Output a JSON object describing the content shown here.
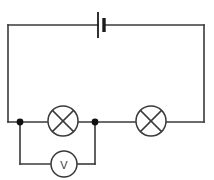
{
  "diagram": {
    "background_color": "#ffffff",
    "line_color": "#3a3a3a",
    "junction_color": "#111111",
    "width": 214,
    "height": 180
  },
  "components": {
    "battery": {
      "name": "battery",
      "symbol": "battery-cell",
      "label": "",
      "position": {
        "x": 101,
        "y": 25
      },
      "long_plate_height": 26,
      "short_plate_height": 14,
      "plate_gap": 5
    },
    "lamp_left": {
      "name": "lamp",
      "symbol": "lamp-crossed-circle",
      "label": "",
      "center": {
        "x": 63,
        "y": 121
      },
      "radius": 15
    },
    "lamp_right": {
      "name": "lamp",
      "symbol": "lamp-crossed-circle",
      "label": "",
      "center": {
        "x": 151,
        "y": 121
      },
      "radius": 15
    },
    "voltmeter": {
      "name": "voltmeter",
      "symbol": "meter-circle",
      "label": "V",
      "center": {
        "x": 64,
        "y": 164
      },
      "radius": 13
    }
  },
  "junctions": [
    {
      "name": "junction-left",
      "x": 20,
      "y": 122,
      "radius": 3.4
    },
    {
      "name": "junction-middle",
      "x": 95,
      "y": 122,
      "radius": 3.4
    }
  ],
  "wires": {
    "main_loop": {
      "left_x": 8,
      "right_x": 204,
      "top_y": 25,
      "bottom_y": 122
    },
    "voltmeter_branch": {
      "left_x": 20,
      "right_x": 95,
      "drop_to_y": 164
    }
  }
}
